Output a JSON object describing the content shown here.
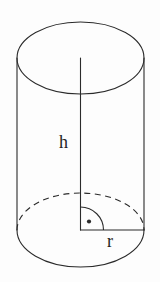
{
  "figure": {
    "name": "cylinder-diagram",
    "background_color": "#fdfdfd",
    "stroke_color": "#2b2b2b",
    "label_color": "#242424"
  },
  "labels": {
    "height": "h",
    "radius": "r"
  },
  "geometry": {
    "canvas": {
      "width": 160,
      "height": 282
    },
    "axis_center_x": 80.5,
    "ellipse_rx": 63.5,
    "top_ellipse": {
      "cy": 58,
      "ry": 36
    },
    "bottom_ellipse": {
      "cy": 230,
      "ry": 37
    },
    "left_side_x": 17,
    "right_side_x": 144,
    "height_line": {
      "x": 80.5,
      "y1": 58,
      "y2": 230
    },
    "radius_line": {
      "y": 230,
      "x1": 80.5,
      "x2": 144
    },
    "right_angle_marker": {
      "cx": 80.5,
      "cy": 230,
      "arc_radius": 23,
      "dot_radius": 2.1
    }
  },
  "annotations": {
    "right_angle_marker_name": "right-angle-marker",
    "hidden_edge_style": "dashed",
    "visible_edge_style": "solid"
  }
}
